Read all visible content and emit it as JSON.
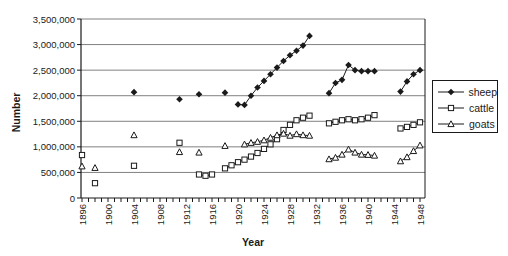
{
  "chart_data": {
    "type": "line",
    "title": "",
    "xlabel": "Year",
    "ylabel": "Number",
    "xlim": [
      1896,
      1949
    ],
    "ylim": [
      0,
      3500000
    ],
    "grid": "horizontal-gridlines-every-500000",
    "legend_position": "right-outside",
    "x_minor_tick_step_years": 1,
    "x_labeled_tick_step_years": 4,
    "x_tick_labels": [
      "1896",
      "1900",
      "1904",
      "1908",
      "1912",
      "1916",
      "1920",
      "1924",
      "1928",
      "1932",
      "1936",
      "1940",
      "1944",
      "1948"
    ],
    "y_tick_step": 500000,
    "y_tick_labels": [
      "0",
      "500,000",
      "1,000,000",
      "1,500,000",
      "2,000,000",
      "2,500,000",
      "3,000,000",
      "3,500,000"
    ],
    "series": [
      {
        "name": "sheep",
        "marker": "filled-diamond",
        "color": "#1a1a1a",
        "segments": [
          [
            [
              1904,
              2070000
            ]
          ],
          [
            [
              1911,
              1930000
            ]
          ],
          [
            [
              1914,
              2030000
            ]
          ],
          [
            [
              1918,
              2060000
            ]
          ],
          [
            [
              1920,
              1830000
            ],
            [
              1921,
              1820000
            ],
            [
              1922,
              2000000
            ],
            [
              1923,
              2160000
            ],
            [
              1924,
              2290000
            ],
            [
              1925,
              2420000
            ],
            [
              1926,
              2550000
            ],
            [
              1927,
              2680000
            ],
            [
              1928,
              2790000
            ],
            [
              1929,
              2880000
            ],
            [
              1930,
              2980000
            ],
            [
              1931,
              3170000
            ]
          ],
          [
            [
              1934,
              2050000
            ],
            [
              1935,
              2250000
            ],
            [
              1936,
              2310000
            ],
            [
              1937,
              2600000
            ],
            [
              1938,
              2500000
            ],
            [
              1939,
              2480000
            ],
            [
              1940,
              2480000
            ],
            [
              1941,
              2480000
            ]
          ],
          [
            [
              1945,
              2080000
            ],
            [
              1946,
              2280000
            ],
            [
              1947,
              2420000
            ],
            [
              1948,
              2500000
            ]
          ]
        ]
      },
      {
        "name": "cattle",
        "marker": "open-square",
        "color": "#1a1a1a",
        "segments": [
          [
            [
              1896,
              840000
            ]
          ],
          [
            [
              1898,
              290000
            ]
          ],
          [
            [
              1904,
              630000
            ]
          ],
          [
            [
              1911,
              1080000
            ]
          ],
          [
            [
              1914,
              460000
            ],
            [
              1915,
              435000
            ],
            [
              1916,
              460000
            ]
          ],
          [
            [
              1918,
              580000
            ],
            [
              1919,
              640000
            ],
            [
              1920,
              700000
            ],
            [
              1921,
              750000
            ],
            [
              1922,
              810000
            ],
            [
              1923,
              880000
            ],
            [
              1924,
              960000
            ],
            [
              1925,
              1050000
            ],
            [
              1926,
              1150000
            ],
            [
              1927,
              1330000
            ],
            [
              1928,
              1430000
            ],
            [
              1929,
              1520000
            ],
            [
              1930,
              1570000
            ],
            [
              1931,
              1610000
            ]
          ],
          [
            [
              1934,
              1460000
            ],
            [
              1935,
              1490000
            ],
            [
              1936,
              1520000
            ],
            [
              1937,
              1540000
            ],
            [
              1938,
              1520000
            ],
            [
              1939,
              1540000
            ],
            [
              1940,
              1570000
            ],
            [
              1941,
              1620000
            ]
          ],
          [
            [
              1945,
              1360000
            ],
            [
              1946,
              1390000
            ],
            [
              1947,
              1430000
            ],
            [
              1948,
              1480000
            ]
          ]
        ]
      },
      {
        "name": "goats",
        "marker": "open-triangle",
        "color": "#1a1a1a",
        "segments": [
          [
            [
              1896,
              620000
            ]
          ],
          [
            [
              1898,
              590000
            ]
          ],
          [
            [
              1904,
              1230000
            ]
          ],
          [
            [
              1911,
              900000
            ]
          ],
          [
            [
              1914,
              890000
            ]
          ],
          [
            [
              1918,
              1020000
            ]
          ],
          [
            [
              1921,
              1050000
            ],
            [
              1922,
              1080000
            ],
            [
              1923,
              1100000
            ],
            [
              1924,
              1130000
            ],
            [
              1925,
              1180000
            ],
            [
              1926,
              1230000
            ],
            [
              1927,
              1260000
            ],
            [
              1928,
              1220000
            ],
            [
              1929,
              1250000
            ],
            [
              1930,
              1230000
            ],
            [
              1931,
              1220000
            ]
          ],
          [
            [
              1934,
              760000
            ],
            [
              1935,
              790000
            ],
            [
              1936,
              850000
            ],
            [
              1937,
              950000
            ],
            [
              1938,
              890000
            ],
            [
              1939,
              850000
            ],
            [
              1940,
              845000
            ],
            [
              1941,
              830000
            ]
          ],
          [
            [
              1945,
              720000
            ],
            [
              1946,
              800000
            ],
            [
              1947,
              920000
            ],
            [
              1948,
              1030000
            ]
          ]
        ]
      }
    ]
  },
  "legend": {
    "items": [
      "sheep",
      "cattle",
      "goats"
    ]
  },
  "colors": {
    "foreground": "#1a1a1a",
    "gridline": "#808080",
    "background": "#ffffff"
  }
}
